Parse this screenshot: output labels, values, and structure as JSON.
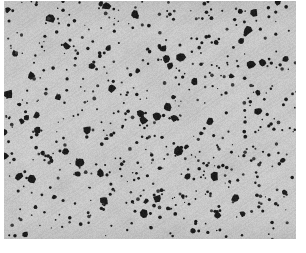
{
  "figure": {
    "kind": "micrograph",
    "caption": "Grayscale micrograph: dark irregular particle phase dispersed in a light grey matrix",
    "canvas": {
      "width": 306,
      "height": 253
    },
    "page_background": "#ffffff"
  },
  "image_region": {
    "x": 4,
    "y": 1,
    "width": 292,
    "height": 238,
    "matrix_color": "#c9c9c9",
    "matrix_color_light": "#d6d6d6",
    "matrix_color_dark": "#bdbdbd",
    "particle_color": "#1c1c1c",
    "particle_color_soft": "#3a3a3a",
    "edge_vignette_color": "#b4b4b4"
  },
  "texture": {
    "seed": 20250714,
    "background_noise_amount": 14,
    "diagonal_stripe_angle_deg": -34,
    "diagonal_stripe_period_px": 3.4,
    "diagonal_stripe_contrast": 7,
    "mottle_blob_count": 150,
    "mottle_radius_min": 6,
    "mottle_radius_max": 26,
    "mottle_contrast": 9
  },
  "particles": {
    "cluster_count": 560,
    "cluster_segments_min": 2,
    "cluster_segments_max": 7,
    "segment_length_min": 2.0,
    "segment_length_max": 6.5,
    "stroke_width_min": 2.2,
    "stroke_width_max": 4.6,
    "turn_jitter_rad": 1.05,
    "speck_count": 620,
    "speck_radius_min": 0.6,
    "speck_radius_max": 1.9,
    "large_blob_count": 70,
    "large_blob_radius_min": 2.4,
    "large_blob_radius_max": 4.4,
    "area_fraction_estimate": 0.27,
    "density_gradient_bottom_boost": 0.16
  },
  "clear_patches": [
    {
      "cx": 0.4,
      "cy": 0.22,
      "r": 0.085
    },
    {
      "cx": 0.62,
      "cy": 0.16,
      "r": 0.06
    },
    {
      "cx": 0.22,
      "cy": 0.55,
      "r": 0.055
    },
    {
      "cx": 0.5,
      "cy": 0.47,
      "r": 0.05
    },
    {
      "cx": 0.78,
      "cy": 0.38,
      "r": 0.055
    }
  ]
}
